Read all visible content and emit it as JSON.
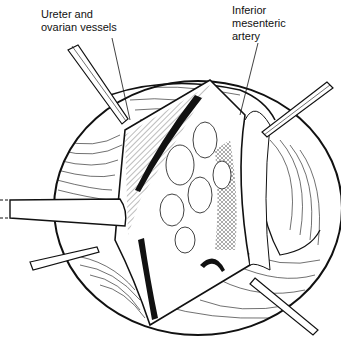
{
  "figure": {
    "type": "surgical line illustration",
    "labels": [
      {
        "id": "ureter",
        "text": "Ureter and\novarian vessels"
      },
      {
        "id": "ima",
        "text": "Inferior\nmesenteric\nartery"
      }
    ],
    "colors": {
      "ink": "#111111",
      "background": "#ffffff"
    }
  }
}
